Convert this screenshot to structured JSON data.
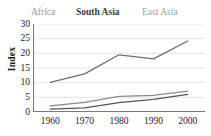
{
  "chart_data": {
    "type": "line",
    "title": "",
    "xlabel": "",
    "ylabel": "Index",
    "categories": [
      "1960",
      "1970",
      "1980",
      "1990",
      "2000"
    ],
    "x": [
      1960,
      1970,
      1980,
      1990,
      2000
    ],
    "xlim": [
      1955,
      2005
    ],
    "ylim": [
      0,
      30
    ],
    "yticks": [
      0,
      5,
      10,
      15,
      20,
      25,
      30
    ],
    "ytick_labels": [
      "0",
      "5",
      "10",
      "15",
      "20",
      "25",
      "30"
    ],
    "grid": "horizontal",
    "legend_position": "top",
    "series": [
      {
        "name": "Africa",
        "color": "#555555",
        "values": [
          1.0,
          1.4,
          3.2,
          4.3,
          6.0
        ]
      },
      {
        "name": "South Asia",
        "color": "#8a8a8a",
        "values": [
          2.1,
          3.3,
          5.3,
          5.7,
          7.1
        ]
      },
      {
        "name": "East Asia",
        "color": "#6e6e6e",
        "values": [
          10.1,
          13.0,
          19.5,
          18.1,
          24.2
        ]
      }
    ]
  },
  "legend": {
    "items": [
      {
        "label": "Africa",
        "color": "#9a9a9a"
      },
      {
        "label": "South Asia",
        "color": "#3d3d3d"
      },
      {
        "label": "East Asia",
        "color": "#9f9f9f"
      }
    ]
  },
  "axes": {
    "y_label": "Index",
    "y_ticks": [
      "30",
      "25",
      "20",
      "15",
      "10",
      "5",
      "0"
    ],
    "x_ticks": [
      "1960",
      "1970",
      "1980",
      "1990",
      "2000"
    ]
  },
  "colors": {
    "background": "#ffffff",
    "grid": "#d8d8d8",
    "axis": "#7a7a7a",
    "text": "#1d1d1d"
  }
}
